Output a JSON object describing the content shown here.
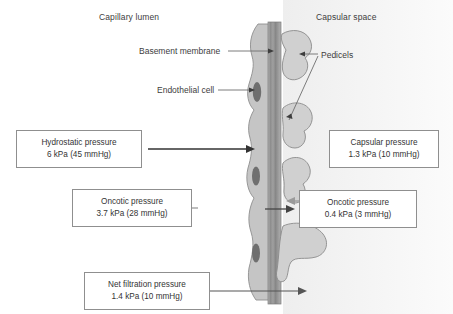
{
  "diagram": {
    "regions": [
      {
        "name": "capillary-lumen",
        "label": "Capillary lumen"
      },
      {
        "name": "capsular-space",
        "label": "Capsular space"
      }
    ],
    "structure_labels": [
      {
        "name": "basement-membrane",
        "label": "Basement membrane"
      },
      {
        "name": "endothelial-cell",
        "label": "Endothelial cell"
      },
      {
        "name": "pedicels",
        "label": "Pedicels"
      }
    ],
    "pressures": [
      {
        "name": "hydrostatic-pressure",
        "title": "Hydrostatic pressure",
        "value": "6 kPa (45 mmHg)",
        "kpa": 6,
        "mmhg": 45,
        "direction": "right",
        "arrow_color": "#333333"
      },
      {
        "name": "capsular-pressure",
        "title": "Capsular pressure",
        "value": "1.3 kPa (10 mmHg)",
        "kpa": 1.3,
        "mmhg": 10,
        "direction": "left",
        "arrow_color": "#9a9a9a"
      },
      {
        "name": "oncotic-pressure-plasma",
        "title": "Oncotic pressure",
        "value": "3.7 kPa (28 mmHg)",
        "kpa": 3.7,
        "mmhg": 28,
        "direction": "left",
        "arrow_color": "#9a9a9a"
      },
      {
        "name": "oncotic-pressure-filtrate",
        "title": "Oncotic pressure",
        "value": "0.4 kPa (3 mmHg)",
        "kpa": 0.4,
        "mmhg": 3,
        "direction": "right",
        "arrow_color": "#444444"
      },
      {
        "name": "net-filtration-pressure",
        "title": "Net filtration pressure",
        "value": "1.4 kPa (10 mmHg)",
        "kpa": 1.4,
        "mmhg": 10,
        "direction": "right",
        "arrow_color": "#555555"
      }
    ],
    "colors": {
      "membrane_dark": "#8a8a8a",
      "membrane_mid": "#a6a6a6",
      "cell_fill": "#c2c2c2",
      "pedicel_fill": "#cfcfcf",
      "nucleus_fill": "#6d6d6d",
      "capsular_space_bg": "#f2f2f2",
      "box_border": "#8f8f8f",
      "text": "#3a3a3a"
    }
  }
}
